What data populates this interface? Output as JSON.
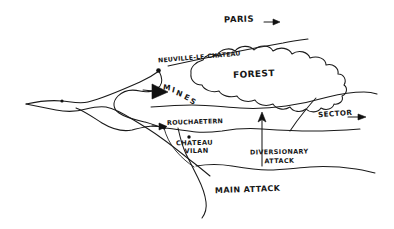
{
  "document": {
    "kind": "hand-drawn tactical sketch map",
    "background_color": "#ffffff",
    "ink_color": "#1a1a1a"
  },
  "labels": {
    "paris": "PARIS",
    "paris_arrow": "→",
    "neuville_le_chateau": "NEUVILLE-LE-CHATEAU",
    "forest": "FOREST",
    "mines": "MINES",
    "mines_letters": [
      "M",
      "I",
      "N",
      "E",
      "S"
    ],
    "rouchaetern": "ROUCHAETERN",
    "chateau_line1": "CHATEAU",
    "chateau_line2": "VILAN",
    "sector": "SECTOR",
    "sector_arrow": "→",
    "diversionary_line1": "DIVERSIONARY",
    "diversionary_line2": "ATTACK",
    "main_attack": "MAIN ATTACK"
  },
  "markers": {
    "arrow_mines": "filled-triangle-arrow-pointing-right",
    "arrow_rouchaetern": "small-filled-triangle-arrow-pointing-right",
    "arrow_diversionary": "vertical-arrow-pointing-up",
    "arrow_paris": "short-arrow-pointing-right",
    "arrow_sector": "short-arrow-pointing-right",
    "node_neuville": "filled-dot",
    "node_rouchaetern": "filled-dot",
    "node_chateau_vilan": "filled-dot",
    "node_west_junction": "filled-dot"
  }
}
